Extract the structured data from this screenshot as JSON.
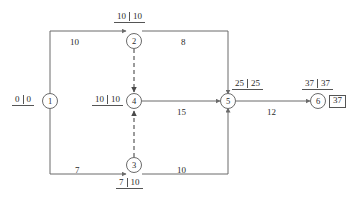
{
  "diagram": {
    "type": "activity-on-arrow-network",
    "nodes": [
      {
        "id": "1",
        "label": "1",
        "x": 50,
        "y": 101,
        "times": {
          "early": "0",
          "late": "0",
          "position": "left"
        }
      },
      {
        "id": "2",
        "label": "2",
        "x": 134,
        "y": 41,
        "times": {
          "early": "10",
          "late": "10",
          "position": "above"
        }
      },
      {
        "id": "3",
        "label": "3",
        "x": 134,
        "y": 165,
        "times": {
          "early": "7",
          "late": "10",
          "position": "below"
        }
      },
      {
        "id": "4",
        "label": "4",
        "x": 134,
        "y": 101,
        "times": {
          "early": "10",
          "late": "10",
          "position": "left"
        }
      },
      {
        "id": "5",
        "label": "5",
        "x": 228,
        "y": 101,
        "times": {
          "early": "25",
          "late": "25",
          "position": "above-right"
        }
      },
      {
        "id": "6",
        "label": "6",
        "x": 318,
        "y": 101,
        "times": {
          "early": "37",
          "late": "37",
          "position": "above"
        },
        "boxed_value": "37"
      }
    ],
    "edges": [
      {
        "from": "1",
        "to": "2",
        "weight": "10",
        "style": "solid",
        "label_x": 70,
        "label_y": 38
      },
      {
        "from": "2",
        "to": "5",
        "weight": "8",
        "style": "solid",
        "label_x": 180,
        "label_y": 38
      },
      {
        "from": "4",
        "to": "5",
        "weight": "15",
        "style": "solid",
        "label_x": 178,
        "label_y": 108
      },
      {
        "from": "5",
        "to": "6",
        "weight": "12",
        "style": "solid",
        "label_x": 268,
        "label_y": 108
      },
      {
        "from": "1",
        "to": "3",
        "weight": "7",
        "style": "solid",
        "label_x": 73,
        "label_y": 166
      },
      {
        "from": "3",
        "to": "5",
        "weight": "10",
        "style": "solid",
        "label_x": 178,
        "label_y": 166
      },
      {
        "from": "2",
        "to": "4",
        "weight": "",
        "style": "dashed",
        "label_x": 0,
        "label_y": 0
      },
      {
        "from": "3",
        "to": "4",
        "weight": "",
        "style": "dashed",
        "label_x": 0,
        "label_y": 0
      }
    ],
    "colors": {
      "line": "#6b6b6b",
      "text": "#2b2b2b",
      "node_stroke": "#6b6b6b",
      "background": "#ffffff"
    }
  }
}
